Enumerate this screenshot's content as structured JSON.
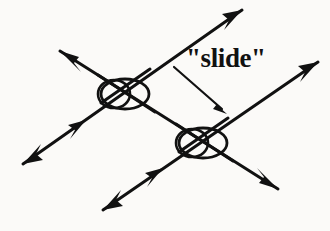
{
  "figure": {
    "kind": "knot-theory-diagram",
    "caption_label": "\"slide\"",
    "background_color": "#fbfaf8",
    "ink_color": "#111111",
    "stroke_width": 3,
    "crossing_ring": {
      "shape": "ellipse-pair",
      "rx": 24,
      "ry": 15,
      "secondary_offset_x": -11,
      "secondary_rx": 16,
      "secondary_ry": 14
    },
    "crossings": [
      {
        "name": "upper-left-crossing",
        "cx": 125,
        "cy": 94
      },
      {
        "name": "lower-right-crossing",
        "cx": 203,
        "cy": 143
      }
    ],
    "strands": [
      {
        "name": "strand-ne-sw-upper",
        "description": "long strand running lower-left to upper-right through both crossings",
        "x1": 23,
        "y1": 164,
        "x2": 242,
        "y2": 10,
        "start_arrow": true,
        "end_arrow": true,
        "mid_arrows": [
          {
            "t": 0.28,
            "direction": "up-right"
          }
        ]
      },
      {
        "name": "strand-nw-se-upper",
        "description": "strand from upper-left down through upper crossing to lower-right",
        "x1": 60,
        "y1": 51,
        "x2": 278,
        "y2": 189,
        "start_arrow": true,
        "end_arrow": true,
        "mid_arrows": []
      },
      {
        "name": "strand-ne-sw-lower",
        "description": "strand from bottom-left up to the right edge through lower crossing",
        "x1": 103,
        "y1": 210,
        "x2": 318,
        "y2": 62,
        "start_arrow": true,
        "end_arrow": true,
        "mid_arrows": [
          {
            "t": 0.26,
            "direction": "up-right"
          }
        ]
      }
    ],
    "slide_arrow": {
      "name": "slide-arrow",
      "x1": 174,
      "y1": 67,
      "x2": 226,
      "y2": 113,
      "head": "end",
      "stroke_width": 2
    },
    "arrow_tips": [
      {
        "name": "arrow-tip-top-right",
        "x": 242,
        "y": 10,
        "direction": "up-right"
      },
      {
        "name": "arrow-tip-upper-left",
        "x": 60,
        "y": 51,
        "direction": "up-left"
      },
      {
        "name": "arrow-tip-right",
        "x": 318,
        "y": 62,
        "direction": "up-right"
      },
      {
        "name": "arrow-tip-lower-left",
        "x": 23,
        "y": 164,
        "direction": "down-left"
      },
      {
        "name": "arrow-tip-lower-right",
        "x": 278,
        "y": 189,
        "direction": "down-right"
      },
      {
        "name": "arrow-tip-bottom",
        "x": 103,
        "y": 210,
        "direction": "down-left"
      }
    ]
  }
}
